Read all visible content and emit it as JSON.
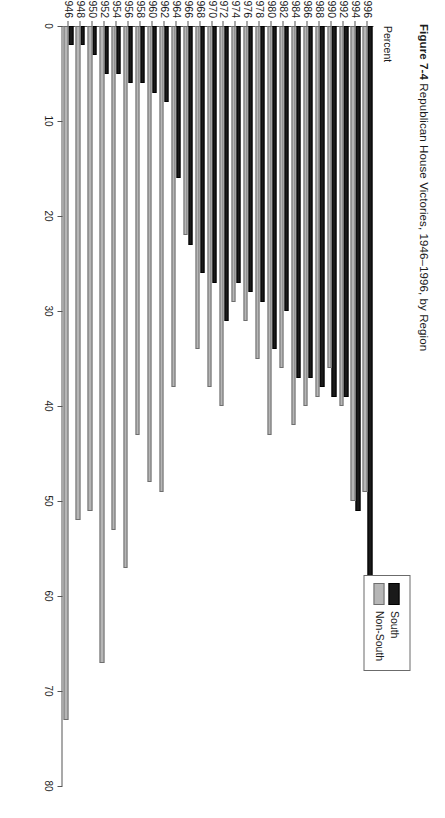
{
  "figure": {
    "number": "Figure 7-4",
    "title": "Republican House Victories, 1946–1996, by Region"
  },
  "axis": {
    "value_label": "Percent",
    "value_ticks": [
      "0",
      "10",
      "20",
      "30",
      "40",
      "50",
      "60",
      "70",
      "80"
    ]
  },
  "legend": {
    "items": [
      {
        "label": "South",
        "color": "#1a1a1a"
      },
      {
        "label": "Non-South",
        "color": "#b6b6b6"
      }
    ]
  },
  "chart_data": {
    "type": "bar",
    "orientation": "horizontal",
    "title": "Republican House Victories, 1946–1996, by Region",
    "xlabel": "Percent",
    "ylabel": "",
    "xlim": [
      0,
      80
    ],
    "grid": false,
    "legend_position": "top-right",
    "categories": [
      "1946",
      "1948",
      "1950",
      "1952",
      "1954",
      "1956",
      "1958",
      "1960",
      "1962",
      "1964",
      "1966",
      "1968",
      "1970",
      "1972",
      "1974",
      "1976",
      "1978",
      "1980",
      "1982",
      "1984",
      "1986",
      "1988",
      "1990",
      "1992",
      "1994",
      "1996"
    ],
    "series": [
      {
        "name": "South",
        "color": "#1a1a1a",
        "values": [
          2,
          2,
          3,
          5,
          5,
          6,
          6,
          7,
          8,
          16,
          23,
          26,
          27,
          31,
          27,
          28,
          29,
          34,
          30,
          37,
          37,
          38,
          39,
          39,
          51,
          58
        ]
      },
      {
        "name": "Non-South",
        "color": "#b6b6b6",
        "values": [
          73,
          52,
          51,
          67,
          53,
          57,
          43,
          48,
          49,
          38,
          22,
          34,
          38,
          40,
          29,
          31,
          35,
          43,
          36,
          42,
          40,
          39,
          36,
          40,
          50,
          49
        ]
      }
    ]
  }
}
